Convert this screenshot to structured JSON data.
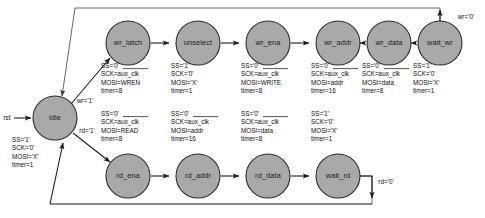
{
  "diagram": {
    "type": "state-machine",
    "colors": {
      "node_fill": "#a9a9a9",
      "node_stroke": "#2b2b2b",
      "edge": "#1c1c1c",
      "loop_edge": "#555555",
      "text": "#0d0d0d",
      "background": "#ffffff"
    },
    "reset_label": "rst",
    "states": [
      {
        "id": "idle",
        "label": "idle",
        "cx": 55,
        "cy": 118,
        "r": 22,
        "actions": [
          "SS='1'",
          "SCK='0'",
          "MOSI='X'",
          "timer=1"
        ],
        "actions_x": 12,
        "actions_y": 140,
        "sck_overbar": false
      },
      {
        "id": "wr_latch",
        "label": "wr_latch",
        "cx": 128,
        "cy": 43,
        "r": 22,
        "actions": [
          "SS='0'",
          "SCK=aux_clk",
          "MOSI=WREN",
          "timer=8"
        ],
        "actions_x": 101,
        "actions_y": 66,
        "sck_overbar": true
      },
      {
        "id": "unselect",
        "label": "unselect",
        "cx": 198,
        "cy": 43,
        "r": 22,
        "actions": [
          "SS='1'",
          "SCK='0'",
          "MOSI='X'",
          "timer=1"
        ],
        "actions_x": 171,
        "actions_y": 66,
        "sck_overbar": false
      },
      {
        "id": "wr_ena",
        "label": "wr_ena",
        "cx": 268,
        "cy": 43,
        "r": 22,
        "actions": [
          "SS='0'",
          "SCK=aux_clk",
          "MOSI=WRITE",
          "timer=8"
        ],
        "actions_x": 241,
        "actions_y": 66,
        "sck_overbar": true
      },
      {
        "id": "wr_addr",
        "label": "wr_addr",
        "cx": 338,
        "cy": 43,
        "r": 22,
        "actions": [
          "SS='0'",
          "SCK=aux_clk",
          "MOSI=addr",
          "timer=16"
        ],
        "actions_x": 311,
        "actions_y": 66,
        "sck_overbar": true
      },
      {
        "id": "wr_data",
        "label": "wr_data",
        "cx": 389,
        "cy": 43,
        "r": 22,
        "actions": [
          "SS='0'",
          "SCK=aux_clk",
          "MOSI=data",
          "timer=8"
        ],
        "actions_x": 362,
        "actions_y": 66,
        "sck_overbar": true
      },
      {
        "id": "wait_wr",
        "label": "wait_wr",
        "cx": 440,
        "cy": 43,
        "r": 22,
        "actions": [
          "SS='1'",
          "SCK='0'",
          "MOSI='X'",
          "timer=1"
        ],
        "actions_x": 413,
        "actions_y": 66,
        "sck_overbar": false
      },
      {
        "id": "rd_ena",
        "label": "rd_ena",
        "cx": 128,
        "cy": 176,
        "r": 22,
        "actions": [
          "SS='0'",
          "SCK=aux_clk",
          "MOSI=READ",
          "timer=8"
        ],
        "actions_x": 101,
        "actions_y": 114,
        "sck_overbar": true
      },
      {
        "id": "rd_addr",
        "label": "rd_addr",
        "cx": 198,
        "cy": 176,
        "r": 22,
        "actions": [
          "SS='0'",
          "SCK=aux_clk",
          "MOSI=addr",
          "timer=16"
        ],
        "actions_x": 171,
        "actions_y": 114,
        "sck_overbar": true
      },
      {
        "id": "rd_data",
        "label": "rd_data",
        "cx": 268,
        "cy": 176,
        "r": 22,
        "actions": [
          "SS='0'",
          "SCK=aux_clk",
          "MOSI=data",
          "timer=8"
        ],
        "actions_x": 241,
        "actions_y": 114,
        "sck_overbar": true
      },
      {
        "id": "wait_rd",
        "label": "wait_rd",
        "cx": 338,
        "cy": 176,
        "r": 22,
        "actions": [
          "SS='1'",
          "SCK='0'",
          "MOSI='X'",
          "timer=1"
        ],
        "actions_x": 311,
        "actions_y": 114,
        "sck_overbar": false
      }
    ],
    "transitions": [
      {
        "id": "rst-to-idle",
        "from": "rst",
        "to": "idle",
        "label": ""
      },
      {
        "id": "idle-to-wr_latch",
        "from": "idle",
        "to": "wr_latch",
        "label": "wr='1'",
        "lx": 85,
        "ly": 101
      },
      {
        "id": "idle-to-rd_ena",
        "from": "idle",
        "to": "rd_ena",
        "label": "rd='1'",
        "lx": 85,
        "ly": 130
      },
      {
        "id": "wr_latch-to-unselect",
        "from": "wr_latch",
        "to": "unselect",
        "label": ""
      },
      {
        "id": "unselect-to-wr_ena",
        "from": "unselect",
        "to": "wr_ena",
        "label": ""
      },
      {
        "id": "wr_ena-to-wr_addr",
        "from": "wr_ena",
        "to": "wr_addr",
        "label": ""
      },
      {
        "id": "wr_addr-to-wr_data",
        "from": "wr_addr",
        "to": "wr_data",
        "label": ""
      },
      {
        "id": "wr_data-to-wait_wr",
        "from": "wr_data",
        "to": "wait_wr",
        "label": ""
      },
      {
        "id": "wait_wr-to-idle",
        "from": "wait_wr",
        "to": "idle",
        "label": "wr='0'",
        "lx": 466,
        "ly": 17
      },
      {
        "id": "rd_ena-to-rd_addr",
        "from": "rd_ena",
        "to": "rd_addr",
        "label": ""
      },
      {
        "id": "rd_addr-to-rd_data",
        "from": "rd_addr",
        "to": "rd_data",
        "label": ""
      },
      {
        "id": "rd_data-to-wait_rd",
        "from": "rd_data",
        "to": "wait_rd",
        "label": ""
      },
      {
        "id": "wait_rd-to-idle",
        "from": "wait_rd",
        "to": "idle",
        "label": "rd='0'",
        "lx": 386,
        "ly": 182
      }
    ]
  }
}
